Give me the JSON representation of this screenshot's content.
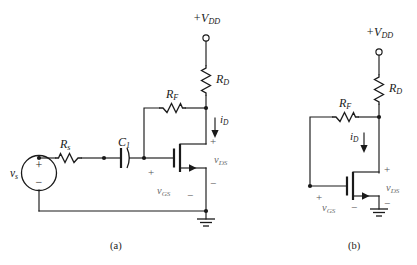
{
  "figure": {
    "background_color": "#ffffff",
    "line_color": "#1a1a1a",
    "sublabel_color": "#6a6a6a"
  },
  "captions": [
    {
      "id": "caption-a",
      "text": "(a)"
    },
    {
      "id": "caption-b",
      "text": "(b)"
    }
  ],
  "circuit_a": {
    "name": "ac-equivalent-amplifier-circuit",
    "supply": {
      "label_sign": "+",
      "label_symbol": "V",
      "label_subscript": "DD",
      "terminal": "open-circle"
    },
    "components": [
      {
        "ref": "R",
        "sub": "D",
        "type": "resistor",
        "orientation": "vertical",
        "name": "resistor-rd"
      },
      {
        "ref": "R",
        "sub": "F",
        "type": "resistor",
        "orientation": "horizontal",
        "name": "resistor-rf"
      },
      {
        "ref": "R",
        "sub": "s",
        "type": "resistor",
        "orientation": "horizontal",
        "name": "resistor-rs"
      },
      {
        "ref": "C",
        "sub": "1",
        "type": "capacitor",
        "orientation": "horizontal",
        "name": "capacitor-c1"
      },
      {
        "ref": "v",
        "sub": "s",
        "type": "voltage-source",
        "orientation": "vertical",
        "name": "source-vs"
      },
      {
        "ref": "M",
        "sub": "1",
        "type": "nmos-transistor",
        "name": "mosfet"
      }
    ],
    "currents": [
      {
        "symbol": "i",
        "sub": "D",
        "direction": "down",
        "name": "current-id"
      }
    ],
    "voltages": [
      {
        "symbol": "v",
        "sub": "DS",
        "plus": "+",
        "minus": "−",
        "name": "voltage-vds"
      },
      {
        "symbol": "v",
        "sub": "GS",
        "plus": "+",
        "minus": "−",
        "name": "voltage-vgs"
      }
    ],
    "source_signs": {
      "plus": "+",
      "minus": "−"
    },
    "ground": "earth-ground"
  },
  "circuit_b": {
    "name": "dc-equivalent-bias-circuit",
    "supply": {
      "label_sign": "+",
      "label_symbol": "V",
      "label_subscript": "DD",
      "terminal": "open-circle"
    },
    "components": [
      {
        "ref": "R",
        "sub": "D",
        "type": "resistor",
        "orientation": "vertical",
        "name": "resistor-rd"
      },
      {
        "ref": "R",
        "sub": "F",
        "type": "resistor",
        "orientation": "horizontal",
        "name": "resistor-rf"
      },
      {
        "ref": "M",
        "sub": "1",
        "type": "nmos-transistor",
        "name": "mosfet"
      }
    ],
    "currents": [
      {
        "symbol": "i",
        "sub": "D",
        "direction": "down",
        "name": "current-id"
      }
    ],
    "voltages": [
      {
        "symbol": "v",
        "sub": "DS",
        "plus": "+",
        "minus": "−",
        "name": "voltage-vds"
      },
      {
        "symbol": "v",
        "sub": "GS",
        "plus": "+",
        "minus": "−",
        "name": "voltage-vgs"
      }
    ],
    "ground": "earth-ground"
  },
  "labels": {
    "a_vdd_sign": "+",
    "a_vdd_sym": "V",
    "a_vdd_sub": "DD",
    "a_rd_sym": "R",
    "a_rd_sub": "D",
    "a_rf_sym": "R",
    "a_rf_sub": "F",
    "a_rs_sym": "R",
    "a_rs_sub": "s",
    "a_c1_sym": "C",
    "a_c1_sub": "1",
    "a_vs_sym": "v",
    "a_vs_sub": "s",
    "a_id_sym": "i",
    "a_id_sub": "D",
    "a_vds_sym": "v",
    "a_vds_sub": "DS",
    "a_vgs_sym": "v",
    "a_vgs_sub": "GS",
    "a_src_plus": "+",
    "a_src_minus": "−",
    "a_vds_plus": "+",
    "a_vds_minus": "−",
    "a_vgs_plus": "+",
    "a_vgs_minus": "−",
    "b_vdd_sign": "+",
    "b_vdd_sym": "V",
    "b_vdd_sub": "DD",
    "b_rd_sym": "R",
    "b_rd_sub": "D",
    "b_rf_sym": "R",
    "b_rf_sub": "F",
    "b_id_sym": "i",
    "b_id_sub": "D",
    "b_vds_sym": "v",
    "b_vds_sub": "DS",
    "b_vgs_sym": "v",
    "b_vgs_sub": "GS",
    "b_vds_plus": "+",
    "b_vds_minus": "−",
    "b_vgs_plus": "+",
    "b_vgs_minus": "−"
  }
}
